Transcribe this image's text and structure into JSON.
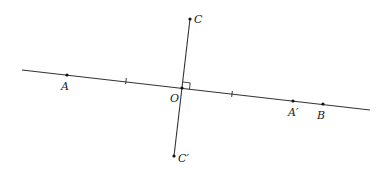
{
  "diagram": {
    "title": "",
    "line_color": "#333333",
    "point_color": "#111111",
    "horizontal_line": {
      "x1": 22,
      "y1": 70,
      "x2": 370,
      "y2": 110
    },
    "perpendicular_line": {
      "x1": 190,
      "y1": 19,
      "x2": 174,
      "y2": 156
    },
    "points": [
      {
        "id": "A",
        "label": "A",
        "x": 67,
        "y": 75,
        "lx": 61,
        "ly": 90
      },
      {
        "id": "O",
        "label": "O",
        "x": 182,
        "y": 88,
        "lx": 170,
        "ly": 102
      },
      {
        "id": "A_prime",
        "label": "A′",
        "x": 293,
        "y": 101,
        "lx": 288,
        "ly": 116
      },
      {
        "id": "B",
        "label": "B",
        "x": 323,
        "y": 104,
        "lx": 317,
        "ly": 119
      },
      {
        "id": "C",
        "label": "C",
        "x": 190,
        "y": 19,
        "lx": 194,
        "ly": 23
      },
      {
        "id": "C_prime",
        "label": "C′",
        "x": 174,
        "y": 156,
        "lx": 178,
        "ly": 162
      }
    ],
    "tick_marks": [
      {
        "x": 126,
        "y": 81
      },
      {
        "x": 232,
        "y": 94
      }
    ],
    "right_angle_at": "O"
  }
}
